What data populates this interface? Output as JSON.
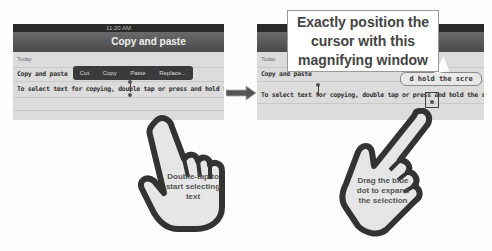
{
  "left_panel": {
    "status_time": "11:20 AM",
    "title": "Copy and paste",
    "date_label": "Today",
    "note_title": "Copy and paste",
    "note_body": "To select text for copying, double tap or press and hold the screen.",
    "popup_menu": [
      "Cut",
      "Copy",
      "Paste",
      "Replace..."
    ]
  },
  "right_panel": {
    "date_label": "Today",
    "note_title": "Copy and paste",
    "note_body": "To select text for copying, double tap or press and hold the screen.",
    "magnifier_text": "d hold the scre"
  },
  "callout": {
    "text": "Exactly position the cursor with this magnifying window"
  },
  "hands": {
    "left_label": "Double-tap to start selecting text",
    "right_label": "Drag the blue dot to expand the selection"
  },
  "icons": {
    "arrow": "right-arrow-icon",
    "hand": "pointing-hand-icon"
  }
}
